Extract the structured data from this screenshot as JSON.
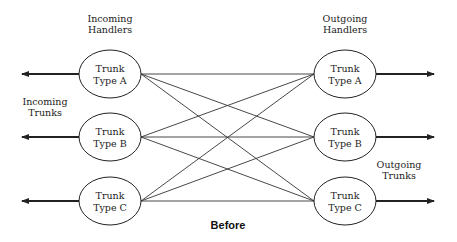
{
  "labels": {
    "incoming_handlers": [
      "Incoming",
      "Handlers"
    ],
    "outgoing_handlers": [
      "Outgoing",
      "Handlers"
    ],
    "incoming_trunks": [
      "Incoming",
      "Trunks"
    ],
    "outgoing_trunks": [
      "Outgoing",
      "Trunks"
    ],
    "caption": "Before"
  },
  "incoming_nodes": [
    {
      "line1": "Trunk",
      "line2": "Type A"
    },
    {
      "line1": "Trunk",
      "line2": "Type B"
    },
    {
      "line1": "Trunk",
      "line2": "Type C"
    }
  ],
  "outgoing_nodes": [
    {
      "line1": "Trunk",
      "line2": "Type A"
    },
    {
      "line1": "Trunk",
      "line2": "Type B"
    },
    {
      "line1": "Trunk",
      "line2": "Type C"
    }
  ],
  "connections": "full-mesh",
  "colors": {
    "stroke": "#222222",
    "background": "#ffffff"
  }
}
